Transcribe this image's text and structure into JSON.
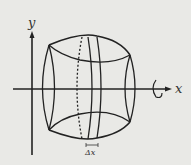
{
  "diagram": {
    "type": "solid-of-revolution",
    "axes": {
      "x_label": "x",
      "y_label": "y"
    },
    "slice_label": "Δx",
    "rotation_indicator": "rotation about x-axis",
    "colors": {
      "background": "#e9e9e6",
      "stroke": "#222222"
    }
  }
}
